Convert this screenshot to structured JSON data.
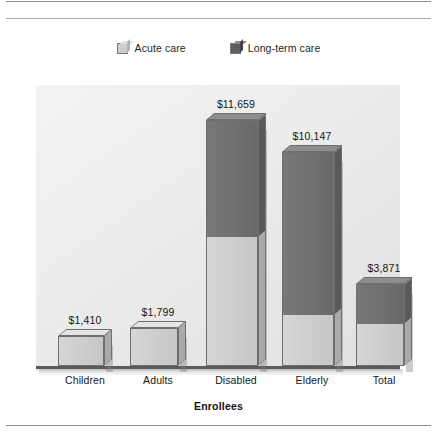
{
  "chart_data": {
    "type": "bar",
    "subtype": "stacked-3d-column",
    "title": "",
    "xlabel": "Enrollees",
    "ylabel": "",
    "ylim": [
      0,
      12500
    ],
    "grid": false,
    "legend_position": "top-center",
    "categories": [
      "Children",
      "Adults",
      "Disabled",
      "Elderly",
      "Total"
    ],
    "series": [
      {
        "name": "Acute care",
        "color": "#cdcdcd",
        "values": [
          1410,
          1799,
          6100,
          2400,
          2000
        ]
      },
      {
        "name": "Long-term care",
        "color": "#707070",
        "values": [
          0,
          0,
          5559,
          7747,
          1871
        ]
      }
    ],
    "totals": [
      1410,
      1799,
      11659,
      10147,
      3871
    ],
    "data_labels": [
      "$1,410",
      "$1,799",
      "$11,659",
      "$10,147",
      "$3,871"
    ]
  },
  "legend": {
    "items": [
      {
        "label": "Acute care",
        "swatch": "acute-care-swatch"
      },
      {
        "label": "Long-term care",
        "swatch": "long-term-care-swatch"
      }
    ]
  },
  "axis": {
    "x_title": "Enrollees"
  },
  "colors": {
    "acute_care": "#cdcdcd",
    "long_term_care": "#707070",
    "plot_background": "#ededed",
    "baseline": "#5a5a5a",
    "rule": "#8d8d8d"
  }
}
